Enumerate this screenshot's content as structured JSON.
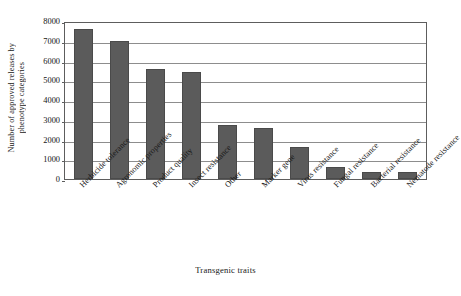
{
  "chart_data": {
    "type": "bar",
    "title": "",
    "subtitle": "",
    "xlabel": "Transgenic traits",
    "ylabel": "Number of approved releases by phenotype categories",
    "ylabel_lines": [
      "Number of approved releases by",
      "phenotype categories"
    ],
    "categories": [
      "Herbicide tolerance",
      "Agronomic properties",
      "Product quality",
      "Insect resistance",
      "Other",
      "Marker gene",
      "Virus resistance",
      "Fungal resistance",
      "Bacterial resistance",
      "Nematode resistance"
    ],
    "values": [
      7600,
      7000,
      5550,
      5400,
      2750,
      2600,
      1600,
      600,
      350,
      330
    ],
    "ylim": [
      0,
      8000
    ],
    "ytick_values": [
      0,
      1000,
      2000,
      3000,
      4000,
      5000,
      6000,
      7000,
      8000
    ],
    "ytick_labels": [
      "0",
      "1000",
      "2000",
      "3000",
      "4000",
      "5000",
      "6000",
      "7000",
      "8000"
    ],
    "grid": true,
    "grid_axis": "y",
    "legend": false,
    "legend_position": "none",
    "bar_color": "#5b5b5b",
    "bar_edge_color": "#4a4a4a",
    "grid_color": "#8d8d8d",
    "axis_color": "#5d5d5d",
    "background_color": "#ffffff",
    "text_color": "#171717"
  }
}
